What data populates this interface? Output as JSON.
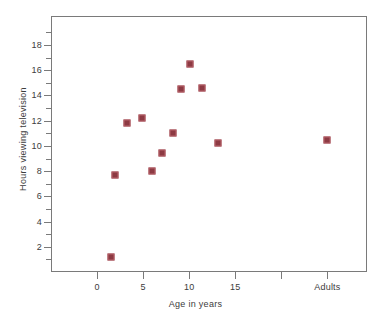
{
  "chart_data": {
    "type": "scatter",
    "title": "",
    "xlabel": "Age in years",
    "ylabel": "Hours viewing television",
    "xlim": [
      -5,
      29.3
    ],
    "ylim": [
      0,
      20.3
    ],
    "grid": false,
    "legend": null,
    "marker_color": "#8d3a43",
    "axis_color": "#7a7a7a",
    "text_color": "#3c3c3c",
    "xticks": [
      {
        "value": 0,
        "label": "0"
      },
      {
        "value": 5,
        "label": "5"
      },
      {
        "value": 10,
        "label": "10"
      },
      {
        "value": 15,
        "label": "15"
      },
      {
        "value": 20,
        "label": ""
      },
      {
        "value": 25,
        "label": "Adults"
      }
    ],
    "yticks_major": [
      {
        "value": 2,
        "label": "2"
      },
      {
        "value": 4,
        "label": "4"
      },
      {
        "value": 6,
        "label": "6"
      },
      {
        "value": 8,
        "label": "8"
      },
      {
        "value": 10,
        "label": "10"
      },
      {
        "value": 12,
        "label": "12"
      },
      {
        "value": 14,
        "label": "14"
      },
      {
        "value": 16,
        "label": "16"
      },
      {
        "value": 18,
        "label": "18"
      }
    ],
    "yticks_minor": [
      1,
      3,
      5,
      7,
      9,
      11,
      13,
      15,
      17,
      19
    ],
    "points": [
      {
        "x": 1.5,
        "y": 1.2
      },
      {
        "x": 1.9,
        "y": 7.7
      },
      {
        "x": 3.2,
        "y": 11.8
      },
      {
        "x": 4.9,
        "y": 12.2
      },
      {
        "x": 6.0,
        "y": 8.0
      },
      {
        "x": 7.0,
        "y": 9.4
      },
      {
        "x": 8.2,
        "y": 11.0
      },
      {
        "x": 9.1,
        "y": 14.5
      },
      {
        "x": 10.1,
        "y": 16.5
      },
      {
        "x": 11.4,
        "y": 14.6
      },
      {
        "x": 13.1,
        "y": 10.2
      },
      {
        "x": 25.0,
        "y": 10.5
      }
    ]
  }
}
